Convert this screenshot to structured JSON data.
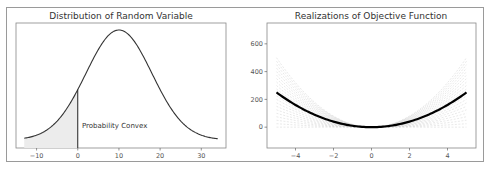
{
  "chart_data": [
    {
      "type": "line",
      "title": "Distribution of Random Variable",
      "xlabel": "",
      "ylabel": "",
      "xlim": [
        -15,
        36
      ],
      "x_ticks": [
        -10,
        0,
        10,
        20,
        30
      ],
      "x_tick_labels": [
        "−10",
        "0",
        "10",
        "20",
        "30"
      ],
      "y_ticks": [],
      "grid": false,
      "series": [
        {
          "name": "normal pdf",
          "mean": 10,
          "std": 8,
          "x_range": [
            -13,
            34
          ],
          "color": "#333333"
        }
      ],
      "shaded_region": {
        "from": -13,
        "to": 0,
        "color": "#e8e8e8"
      },
      "vertical_line": {
        "x": 0
      },
      "annotations": [
        {
          "text": "Probability Convex",
          "x": 0.5,
          "y_frac": 0.2
        }
      ]
    },
    {
      "type": "line",
      "title": "Realizations of Objective Function",
      "xlabel": "",
      "ylabel": "",
      "xlim": [
        -5.5,
        5.5
      ],
      "ylim": [
        -150,
        750
      ],
      "x_ticks": [
        -4,
        -2,
        0,
        2,
        4
      ],
      "x_tick_labels": [
        "−4",
        "−2",
        "0",
        "2",
        "4"
      ],
      "y_ticks": [
        0,
        200,
        400,
        600
      ],
      "y_tick_labels": [
        "0",
        "200",
        "400",
        "600"
      ],
      "grid": false,
      "series": [
        {
          "name": "expected objective (bold)",
          "function": "10*x^2",
          "x": [
            -5,
            -4,
            -3,
            -2,
            -1,
            0,
            1,
            2,
            3,
            4,
            5
          ],
          "values": [
            250,
            160,
            90,
            40,
            10,
            0,
            10,
            40,
            90,
            160,
            250
          ],
          "color": "#000000"
        },
        {
          "name": "realizations (faint dashed)",
          "function": "a*x^2 with a in [0, 20]",
          "x": [
            -5,
            5
          ],
          "max_value_at_edges": 500,
          "color": "#bbbbbb"
        }
      ]
    }
  ]
}
